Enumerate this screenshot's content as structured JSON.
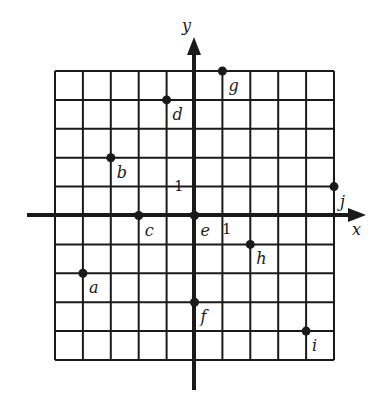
{
  "diagram": {
    "type": "coordinate-grid",
    "axes": {
      "x_label": "x",
      "y_label": "y",
      "x_unit_label": "1",
      "y_unit_label": "1"
    },
    "grid": {
      "x_min": -5,
      "x_max": 5,
      "y_min": -5,
      "y_max": 5
    },
    "points": [
      {
        "label": "a",
        "x": -4,
        "y": -2
      },
      {
        "label": "b",
        "x": -3,
        "y": 2
      },
      {
        "label": "c",
        "x": -2,
        "y": 0
      },
      {
        "label": "d",
        "x": -1,
        "y": 4
      },
      {
        "label": "e",
        "x": 0,
        "y": 0
      },
      {
        "label": "f",
        "x": 0,
        "y": -3
      },
      {
        "label": "g",
        "x": 1,
        "y": 5
      },
      {
        "label": "h",
        "x": 2,
        "y": -1
      },
      {
        "label": "i",
        "x": 4,
        "y": -4
      },
      {
        "label": "j",
        "x": 5,
        "y": 1
      }
    ],
    "colors": {
      "ink": "#1a1a1a",
      "background": "#ffffff"
    }
  }
}
